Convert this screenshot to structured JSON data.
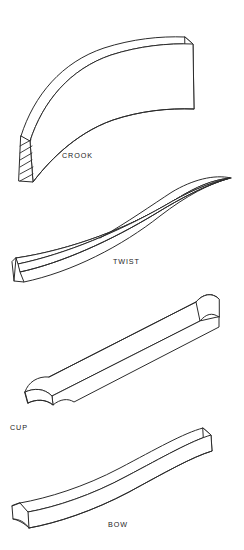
{
  "figure": {
    "background_color": "#ffffff",
    "line_color": "#2b2b2b",
    "label_color": "#1a1a1a",
    "style": "isometric line drawing",
    "width": 244,
    "height": 550
  },
  "labels": {
    "crook": "CROOK",
    "twist": "TWIST",
    "cup": "CUP",
    "bow": "BOW"
  },
  "defects": [
    {
      "name": "CROOK",
      "label": "CROOK",
      "label_x": 62,
      "label_y": 158,
      "description": "board curved sideways along its edge, shown with hatched end grain face",
      "has_end_hatching": true
    },
    {
      "name": "TWIST",
      "label": "TWIST",
      "label_x": 113,
      "label_y": 264,
      "description": "board twisted helically so opposite corners lift, edges cross at center",
      "has_end_hatching": false
    },
    {
      "name": "CUP",
      "label": "CUP",
      "label_x": 10,
      "label_y": 430,
      "description": "board curved across its width forming a concave trough",
      "has_end_hatching": false
    },
    {
      "name": "BOW",
      "label": "BOW",
      "label_x": 108,
      "label_y": 527,
      "description": "board curved along its length from end to end",
      "has_end_hatching": false
    }
  ]
}
